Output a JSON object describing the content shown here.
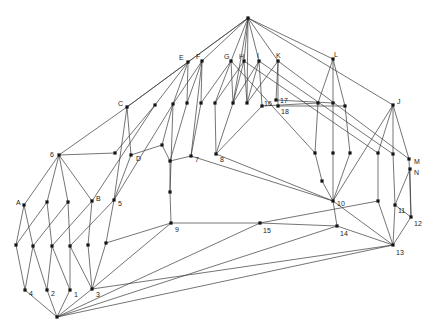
{
  "figure": {
    "title": "",
    "background_color": "#ffffff",
    "edge_color": "#3a3a3a",
    "node_color": "#141414",
    "label_color": "#1c1c1c",
    "node_size": 3.2,
    "edge_width": 0.7,
    "width": 437,
    "height": 334
  },
  "chart_data": {
    "type": "node-link-graph",
    "nodes": [
      {
        "id": "T",
        "label": "",
        "x": 248,
        "y": 18,
        "lx": 0,
        "ly": 0
      },
      {
        "id": "E",
        "label": "E",
        "x": 188,
        "y": 62,
        "lx": -9,
        "ly": -4
      },
      {
        "id": "F",
        "label": "F",
        "x": 202,
        "y": 61,
        "lx": -6,
        "ly": -4
      },
      {
        "id": "G",
        "label": "G",
        "x": 231,
        "y": 61,
        "lx": -7,
        "ly": -4
      },
      {
        "id": "H",
        "label": "H",
        "x": 244,
        "y": 61,
        "lx": -5,
        "ly": -4
      },
      {
        "id": "I",
        "label": "I",
        "x": 259,
        "y": 61,
        "lx": -2,
        "ly": -5
      },
      {
        "id": "K",
        "label": "K",
        "x": 278,
        "y": 61,
        "lx": -2,
        "ly": -5
      },
      {
        "id": "L",
        "label": "L",
        "x": 333,
        "y": 59,
        "lx": 1,
        "ly": -4
      },
      {
        "id": "J",
        "label": "J",
        "x": 393,
        "y": 105,
        "lx": 4,
        "ly": -3
      },
      {
        "id": "C",
        "label": "C",
        "x": 127,
        "y": 107,
        "lx": -9,
        "ly": -3
      },
      {
        "id": "r1",
        "label": "",
        "x": 155,
        "y": 105,
        "lx": 0,
        "ly": 0
      },
      {
        "id": "r2",
        "label": "",
        "x": 173,
        "y": 104,
        "lx": 0,
        "ly": 0
      },
      {
        "id": "r3",
        "label": "",
        "x": 187,
        "y": 103,
        "lx": 0,
        "ly": 0
      },
      {
        "id": "r4",
        "label": "",
        "x": 201,
        "y": 103,
        "lx": 0,
        "ly": 0
      },
      {
        "id": "r5",
        "label": "",
        "x": 215,
        "y": 103,
        "lx": 0,
        "ly": 0
      },
      {
        "id": "r6",
        "label": "",
        "x": 233,
        "y": 103,
        "lx": 0,
        "ly": 0
      },
      {
        "id": "r7",
        "label": "",
        "x": 247,
        "y": 103,
        "lx": 0,
        "ly": 0
      },
      {
        "id": "n16",
        "label": "16",
        "x": 262,
        "y": 106,
        "lx": 2,
        "ly": -2
      },
      {
        "id": "n17",
        "label": "17",
        "x": 276,
        "y": 100,
        "lx": 4,
        "ly": 1
      },
      {
        "id": "n18",
        "label": "18",
        "x": 278,
        "y": 106,
        "lx": 3,
        "ly": 6
      },
      {
        "id": "s1",
        "label": "",
        "x": 318,
        "y": 103,
        "lx": 0,
        "ly": 0
      },
      {
        "id": "s2",
        "label": "",
        "x": 333,
        "y": 103,
        "lx": 0,
        "ly": 0
      },
      {
        "id": "s3",
        "label": "",
        "x": 345,
        "y": 106,
        "lx": 0,
        "ly": 0
      },
      {
        "id": "d0",
        "label": "",
        "x": 115,
        "y": 153,
        "lx": 0,
        "ly": 0
      },
      {
        "id": "D",
        "label": "D",
        "x": 131,
        "y": 155,
        "lx": 5,
        "ly": 4
      },
      {
        "id": "m1",
        "label": "",
        "x": 162,
        "y": 145,
        "lx": 0,
        "ly": 0
      },
      {
        "id": "m2",
        "label": "",
        "x": 170,
        "y": 161,
        "lx": 0,
        "ly": 0
      },
      {
        "id": "n7",
        "label": "7",
        "x": 191,
        "y": 156,
        "lx": 4,
        "ly": 4
      },
      {
        "id": "n8",
        "label": "8",
        "x": 216,
        "y": 154,
        "lx": 4,
        "ly": 6
      },
      {
        "id": "t1",
        "label": "",
        "x": 315,
        "y": 153,
        "lx": 0,
        "ly": 0
      },
      {
        "id": "t2",
        "label": "",
        "x": 333,
        "y": 153,
        "lx": 0,
        "ly": 0
      },
      {
        "id": "t3",
        "label": "",
        "x": 350,
        "y": 153,
        "lx": 0,
        "ly": 0
      },
      {
        "id": "t4",
        "label": "",
        "x": 378,
        "y": 153,
        "lx": 0,
        "ly": 0
      },
      {
        "id": "t5",
        "label": "",
        "x": 393,
        "y": 154,
        "lx": 0,
        "ly": 0
      },
      {
        "id": "M",
        "label": "M",
        "x": 409,
        "y": 159,
        "lx": 5,
        "ly": 3
      },
      {
        "id": "N",
        "label": "N",
        "x": 410,
        "y": 169,
        "lx": 4,
        "ly": 4
      },
      {
        "id": "p1",
        "label": "",
        "x": 322,
        "y": 181,
        "lx": 0,
        "ly": 0
      },
      {
        "id": "q9",
        "label": "",
        "x": 170,
        "y": 192,
        "lx": 0,
        "ly": 0
      },
      {
        "id": "n6",
        "label": "6",
        "x": 59,
        "y": 155,
        "lx": -9,
        "ly": 0
      },
      {
        "id": "A",
        "label": "A",
        "x": 24,
        "y": 205,
        "lx": -8,
        "ly": -2
      },
      {
        "id": "a1",
        "label": "",
        "x": 47,
        "y": 202,
        "lx": 0,
        "ly": 0
      },
      {
        "id": "a2",
        "label": "",
        "x": 68,
        "y": 202,
        "lx": 0,
        "ly": 0
      },
      {
        "id": "B",
        "label": "B",
        "x": 92,
        "y": 201,
        "lx": 4,
        "ly": -2
      },
      {
        "id": "n5",
        "label": "5",
        "x": 114,
        "y": 200,
        "lx": 4,
        "ly": 4
      },
      {
        "id": "n9",
        "label": "9",
        "x": 171,
        "y": 223,
        "lx": 4,
        "ly": 7
      },
      {
        "id": "n15",
        "label": "15",
        "x": 260,
        "y": 223,
        "lx": 3,
        "ly": 8
      },
      {
        "id": "n10",
        "label": "10",
        "x": 333,
        "y": 201,
        "lx": 4,
        "ly": 3
      },
      {
        "id": "u11",
        "label": "",
        "x": 378,
        "y": 201,
        "lx": 0,
        "ly": 0
      },
      {
        "id": "n11",
        "label": "11",
        "x": 395,
        "y": 205,
        "lx": 3,
        "ly": 6
      },
      {
        "id": "n12",
        "label": "12",
        "x": 411,
        "y": 217,
        "lx": 3,
        "ly": 7
      },
      {
        "id": "n14",
        "label": "14",
        "x": 337,
        "y": 226,
        "lx": 3,
        "ly": 8
      },
      {
        "id": "n13",
        "label": "13",
        "x": 393,
        "y": 245,
        "lx": 3,
        "ly": 8
      },
      {
        "id": "b1",
        "label": "",
        "x": 16,
        "y": 245,
        "lx": 0,
        "ly": 0
      },
      {
        "id": "b2",
        "label": "",
        "x": 33,
        "y": 246,
        "lx": 0,
        "ly": 0
      },
      {
        "id": "b3",
        "label": "",
        "x": 52,
        "y": 246,
        "lx": 0,
        "ly": 0
      },
      {
        "id": "b4",
        "label": "",
        "x": 70,
        "y": 246,
        "lx": 0,
        "ly": 0
      },
      {
        "id": "b5",
        "label": "",
        "x": 88,
        "y": 245,
        "lx": 0,
        "ly": 0
      },
      {
        "id": "b6",
        "label": "",
        "x": 106,
        "y": 243,
        "lx": 0,
        "ly": 0
      },
      {
        "id": "n4",
        "label": "4",
        "x": 25,
        "y": 290,
        "lx": 4,
        "ly": 4
      },
      {
        "id": "n2",
        "label": "2",
        "x": 47,
        "y": 290,
        "lx": 4,
        "ly": 4
      },
      {
        "id": "n1",
        "label": "1",
        "x": 70,
        "y": 290,
        "lx": 4,
        "ly": 5
      },
      {
        "id": "n3",
        "label": "3",
        "x": 92,
        "y": 289,
        "lx": 4,
        "ly": 6
      },
      {
        "id": "Z",
        "label": "",
        "x": 57,
        "y": 317,
        "lx": 0,
        "ly": 0
      }
    ],
    "edges": [
      [
        "T",
        "E"
      ],
      [
        "T",
        "F"
      ],
      [
        "T",
        "G"
      ],
      [
        "T",
        "H"
      ],
      [
        "T",
        "I"
      ],
      [
        "T",
        "K"
      ],
      [
        "T",
        "L"
      ],
      [
        "T",
        "J"
      ],
      [
        "T",
        "C"
      ],
      [
        "T",
        "r6"
      ],
      [
        "T",
        "r7"
      ],
      [
        "E",
        "C"
      ],
      [
        "E",
        "r1"
      ],
      [
        "E",
        "r2"
      ],
      [
        "E",
        "r3"
      ],
      [
        "F",
        "r2"
      ],
      [
        "F",
        "r3"
      ],
      [
        "F",
        "r4"
      ],
      [
        "F",
        "n7"
      ],
      [
        "G",
        "r4"
      ],
      [
        "G",
        "r5"
      ],
      [
        "G",
        "r6"
      ],
      [
        "G",
        "t1"
      ],
      [
        "H",
        "r5"
      ],
      [
        "H",
        "r6"
      ],
      [
        "H",
        "r7"
      ],
      [
        "H",
        "t4"
      ],
      [
        "I",
        "r6"
      ],
      [
        "I",
        "r7"
      ],
      [
        "I",
        "n16"
      ],
      [
        "I",
        "t5"
      ],
      [
        "K",
        "r7"
      ],
      [
        "K",
        "n17"
      ],
      [
        "K",
        "n18"
      ],
      [
        "K",
        "M"
      ],
      [
        "L",
        "s1"
      ],
      [
        "L",
        "s2"
      ],
      [
        "L",
        "s3"
      ],
      [
        "J",
        "t4"
      ],
      [
        "J",
        "t5"
      ],
      [
        "J",
        "M"
      ],
      [
        "J",
        "n10"
      ],
      [
        "C",
        "n6"
      ],
      [
        "C",
        "n5"
      ],
      [
        "C",
        "D"
      ],
      [
        "n6",
        "A"
      ],
      [
        "n6",
        "a1"
      ],
      [
        "n6",
        "a2"
      ],
      [
        "n6",
        "B"
      ],
      [
        "n6",
        "d0"
      ],
      [
        "r1",
        "B"
      ],
      [
        "r1",
        "d0"
      ],
      [
        "r2",
        "n5"
      ],
      [
        "r2",
        "m1"
      ],
      [
        "r2",
        "q9"
      ],
      [
        "r3",
        "m2"
      ],
      [
        "r4",
        "n7"
      ],
      [
        "r5",
        "n8"
      ],
      [
        "r6",
        "n8"
      ],
      [
        "n16",
        "s1"
      ],
      [
        "n16",
        "n8"
      ],
      [
        "n17",
        "s2"
      ],
      [
        "n18",
        "s3"
      ],
      [
        "s1",
        "t1"
      ],
      [
        "s2",
        "t2"
      ],
      [
        "s3",
        "t3"
      ],
      [
        "t1",
        "p1"
      ],
      [
        "t2",
        "n10"
      ],
      [
        "t3",
        "n10"
      ],
      [
        "t4",
        "u11"
      ],
      [
        "t5",
        "n11"
      ],
      [
        "M",
        "n12"
      ],
      [
        "N",
        "n11"
      ],
      [
        "N",
        "n12"
      ],
      [
        "p1",
        "n10"
      ],
      [
        "D",
        "n5"
      ],
      [
        "D",
        "m1"
      ],
      [
        "m1",
        "m2"
      ],
      [
        "m2",
        "q9"
      ],
      [
        "q9",
        "n9"
      ],
      [
        "n7",
        "m2"
      ],
      [
        "n7",
        "n10"
      ],
      [
        "n8",
        "n10"
      ],
      [
        "n9",
        "n15"
      ],
      [
        "n9",
        "b6"
      ],
      [
        "n9",
        "n3"
      ],
      [
        "n15",
        "n14"
      ],
      [
        "n15",
        "u11"
      ],
      [
        "Z",
        "n15"
      ],
      [
        "n10",
        "n14"
      ],
      [
        "n10",
        "n13"
      ],
      [
        "n14",
        "n13"
      ],
      [
        "Z",
        "n14"
      ],
      [
        "n13",
        "n12"
      ],
      [
        "n13",
        "n11"
      ],
      [
        "n13",
        "u11"
      ],
      [
        "Z",
        "n13"
      ],
      [
        "n3",
        "n13"
      ],
      [
        "n11",
        "n12"
      ],
      [
        "A",
        "b1"
      ],
      [
        "A",
        "b2"
      ],
      [
        "a1",
        "b1"
      ],
      [
        "a1",
        "b3"
      ],
      [
        "a2",
        "b2"
      ],
      [
        "a2",
        "b4"
      ],
      [
        "B",
        "b3"
      ],
      [
        "B",
        "b5"
      ],
      [
        "n5",
        "b4"
      ],
      [
        "n5",
        "b6"
      ],
      [
        "b1",
        "n4"
      ],
      [
        "b2",
        "n4"
      ],
      [
        "b2",
        "n2"
      ],
      [
        "b3",
        "n2"
      ],
      [
        "b3",
        "n1"
      ],
      [
        "b4",
        "n1"
      ],
      [
        "b4",
        "n3"
      ],
      [
        "b5",
        "n3"
      ],
      [
        "b6",
        "n3"
      ],
      [
        "n4",
        "Z"
      ],
      [
        "n2",
        "Z"
      ],
      [
        "n1",
        "Z"
      ],
      [
        "n3",
        "Z"
      ]
    ]
  }
}
